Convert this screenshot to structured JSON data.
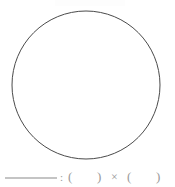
{
  "page": {
    "width": 175,
    "height": 187,
    "background_color": "#ffffff",
    "document_type": "math-worksheet-figure"
  },
  "figure": {
    "shape_name": "circle",
    "center_x": 86,
    "center_y": 85,
    "radius": 74,
    "stroke_color": "#4a4a4a",
    "stroke_width": 1,
    "fill_color": "#ffffff"
  },
  "answer_line": {
    "blank_rule": {
      "label": "answer-blank",
      "x_start": 5,
      "x_end": 57,
      "y": 14,
      "color": "#b0b0b0",
      "thickness": 1.6
    },
    "tokens": [
      {
        "name": "colon",
        "glyph": ":",
        "x": 60
      },
      {
        "name": "open-paren-1",
        "glyph": "(",
        "x": 68
      },
      {
        "name": "close-paren-1",
        "glyph": ")",
        "x": 97
      },
      {
        "name": "multiplication",
        "glyph": "×",
        "x": 111
      },
      {
        "name": "open-paren-2",
        "glyph": "(",
        "x": 127
      },
      {
        "name": "close-paren-2",
        "glyph": ")",
        "x": 156
      }
    ],
    "baseline_y": 17,
    "text_color": "#9a9a9a"
  }
}
